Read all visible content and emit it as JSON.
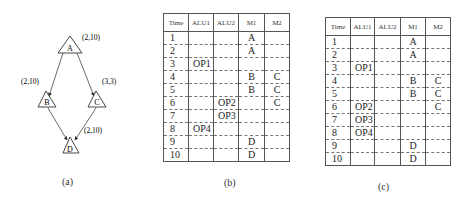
{
  "diagram_a": {
    "nodes": [
      {
        "id": "A",
        "label": "A",
        "annotation": "(2,10)"
      },
      {
        "id": "B",
        "label": "B",
        "annotation": "(2,10)"
      },
      {
        "id": "C",
        "label": "C",
        "annotation": "(3,3)"
      },
      {
        "id": "D",
        "label": "D",
        "annotation": "(2,10)"
      }
    ],
    "edges": [
      {
        "from": "A",
        "to": "B"
      },
      {
        "from": "A",
        "to": "C"
      },
      {
        "from": "B",
        "to": "D"
      },
      {
        "from": "C",
        "to": "D"
      }
    ],
    "caption": "(a)"
  },
  "table_b": {
    "caption": "(b)",
    "headers": [
      "Time",
      "ALU1",
      "ALU2",
      "M1",
      "M2"
    ],
    "rows": [
      [
        "1",
        "",
        "",
        "A",
        ""
      ],
      [
        "2",
        "",
        "",
        "A",
        ""
      ],
      [
        "3",
        "OP1",
        "",
        "",
        ""
      ],
      [
        "4",
        "",
        "",
        "B",
        "C"
      ],
      [
        "5",
        "",
        "",
        "B",
        "C"
      ],
      [
        "6",
        "",
        "OP2",
        "",
        "C"
      ],
      [
        "7",
        "",
        "OP3",
        "",
        ""
      ],
      [
        "8",
        "OP4",
        "",
        "",
        ""
      ],
      [
        "9",
        "",
        "",
        "D",
        ""
      ],
      [
        "10",
        "",
        "",
        "D",
        ""
      ]
    ]
  },
  "table_c": {
    "caption": "(c)",
    "headers": [
      "Time",
      "ALU1",
      "ALU2",
      "M1",
      "M2"
    ],
    "rows": [
      [
        "1",
        "",
        "",
        "A",
        ""
      ],
      [
        "2",
        "",
        "",
        "A",
        ""
      ],
      [
        "3",
        "OP1",
        "",
        "",
        ""
      ],
      [
        "4",
        "",
        "",
        "B",
        "C"
      ],
      [
        "5",
        "",
        "",
        "B",
        "C"
      ],
      [
        "6",
        "OP2",
        "",
        "",
        "C"
      ],
      [
        "7",
        "OP3",
        "",
        "",
        ""
      ],
      [
        "8",
        "OP4",
        "",
        "",
        ""
      ],
      [
        "9",
        "",
        "",
        "D",
        ""
      ],
      [
        "10",
        "",
        "",
        "D",
        ""
      ]
    ]
  }
}
